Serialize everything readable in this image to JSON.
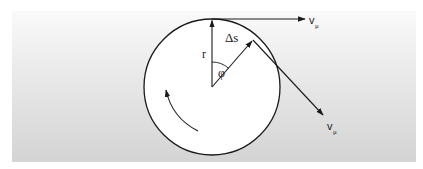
{
  "diagram": {
    "colors": {
      "line": "#1a1a1a",
      "circle_fill": "#ffffff",
      "background_top": "#fafafa",
      "background_bottom": "#d4d4d4"
    },
    "labels": {
      "radius": "r",
      "arc_length": "Δs",
      "angle": "φ",
      "velocity_top": "v",
      "velocity_top_sub": "μ",
      "velocity_tangent": "v",
      "velocity_tangent_sub": "μ"
    },
    "geometry": {
      "circle_center": [
        212,
        87
      ],
      "circle_radius": 68,
      "angle_degrees": 37
    }
  }
}
